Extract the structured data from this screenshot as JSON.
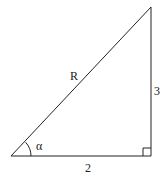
{
  "diagram": {
    "type": "right-triangle",
    "stroke_color": "#222222",
    "labels": {
      "hypotenuse": "R",
      "vertical_leg": "3",
      "horizontal_leg": "2",
      "angle": "α"
    }
  }
}
